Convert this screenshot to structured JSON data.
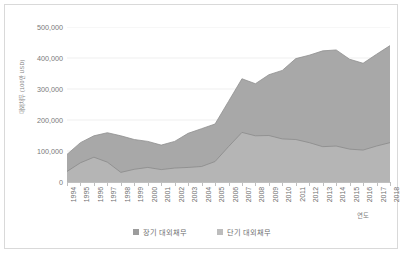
{
  "chart_data": {
    "type": "area",
    "stacked": true,
    "title": "",
    "xlabel": "연도",
    "ylabel": "대외채무 (100만 USD)",
    "ylim": [
      0,
      500000
    ],
    "ytick_labels": [
      "500,000",
      "400,000",
      "300,000",
      "200,000",
      "100,000",
      "0"
    ],
    "ytick_values": [
      500000,
      400000,
      300000,
      200000,
      100000,
      0
    ],
    "grid": true,
    "legend_position": "bottom",
    "categories": [
      "1994",
      "1995",
      "1996",
      "1997",
      "1998",
      "1999",
      "2000",
      "2001",
      "2002",
      "2003",
      "2004",
      "2005",
      "2006",
      "2007",
      "2008",
      "2009",
      "2010",
      "2011",
      "2012",
      "2013",
      "2014",
      "2015",
      "2016",
      "2017",
      "2018"
    ],
    "series": [
      {
        "name": "단기 대외채무",
        "color": "#a6a6a6",
        "values": [
          34000,
          62000,
          80000,
          64000,
          31000,
          41000,
          47000,
          40000,
          45000,
          47000,
          50000,
          66000,
          114000,
          160000,
          149000,
          150000,
          139000,
          137000,
          127000,
          114000,
          116000,
          106000,
          103000,
          116000,
          127000
        ]
      },
      {
        "name": "장기 대외채무",
        "color": "#9c9c9c",
        "values": [
          55000,
          65000,
          69000,
          95000,
          118000,
          96000,
          84000,
          79000,
          86000,
          110000,
          122000,
          121000,
          146000,
          173000,
          168000,
          196000,
          221000,
          261000,
          282000,
          309000,
          310000,
          290000,
          280000,
          296000,
          313000
        ]
      }
    ],
    "totals": [
      89000,
      127000,
      149000,
      159000,
      149000,
      137000,
      131000,
      119000,
      131000,
      157000,
      172000,
      187000,
      260000,
      333000,
      317000,
      346000,
      360000,
      398000,
      409000,
      423000,
      426000,
      396000,
      383000,
      412000,
      440000
    ]
  },
  "legend": {
    "items": [
      {
        "label": "장기 대외채무",
        "color": "#9c9c9c"
      },
      {
        "label": "단기 대외채무",
        "color": "#bdbdbd"
      }
    ]
  }
}
